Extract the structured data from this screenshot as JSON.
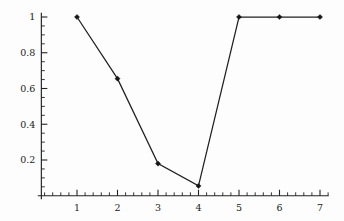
{
  "chart_data": {
    "type": "line",
    "title": "",
    "subtitle": "",
    "xlabel": "",
    "ylabel": "",
    "x": [
      1,
      2,
      3,
      4,
      5,
      6,
      7
    ],
    "values": [
      1,
      0.655,
      0.18,
      0.055,
      1,
      1,
      1
    ],
    "series": [
      {
        "name": "series-1",
        "x": [
          1,
          2,
          3,
          4,
          5,
          6,
          7
        ],
        "values": [
          1,
          0.655,
          0.18,
          0.055,
          1,
          1,
          1
        ]
      }
    ],
    "xlim": [
      0.12,
      7.2
    ],
    "ylim": [
      0,
      1.02
    ],
    "xticks": [
      1,
      2,
      3,
      4,
      5,
      6,
      7
    ],
    "yticks": [
      0.2,
      0.4,
      0.6,
      0.8,
      1
    ],
    "xtick_labels": [
      "1",
      "2",
      "3",
      "4",
      "5",
      "6",
      "7"
    ],
    "ytick_labels": [
      "0.2",
      "0.4",
      "0.6",
      "0.8",
      "1"
    ],
    "x_minor_step": 0.2,
    "y_minor_step": 0.05,
    "grid": false,
    "legend": null,
    "marker": "diamond",
    "line_color": "#1f1f1f",
    "marker_color": "#161616",
    "axis_color": "#222222",
    "background_color": "#fdfdfd",
    "annotations": []
  },
  "axes": {
    "y_labels": [
      {
        "text": "1",
        "value": 1
      },
      {
        "text": "0.8",
        "value": 0.8
      },
      {
        "text": "0.6",
        "value": 0.6
      },
      {
        "text": "0.4",
        "value": 0.4
      },
      {
        "text": "0.2",
        "value": 0.2
      }
    ],
    "x_labels": [
      {
        "text": "1",
        "value": 1
      },
      {
        "text": "2",
        "value": 2
      },
      {
        "text": "3",
        "value": 3
      },
      {
        "text": "4",
        "value": 4
      },
      {
        "text": "5",
        "value": 5
      },
      {
        "text": "6",
        "value": 6
      },
      {
        "text": "7",
        "value": 7
      }
    ]
  }
}
